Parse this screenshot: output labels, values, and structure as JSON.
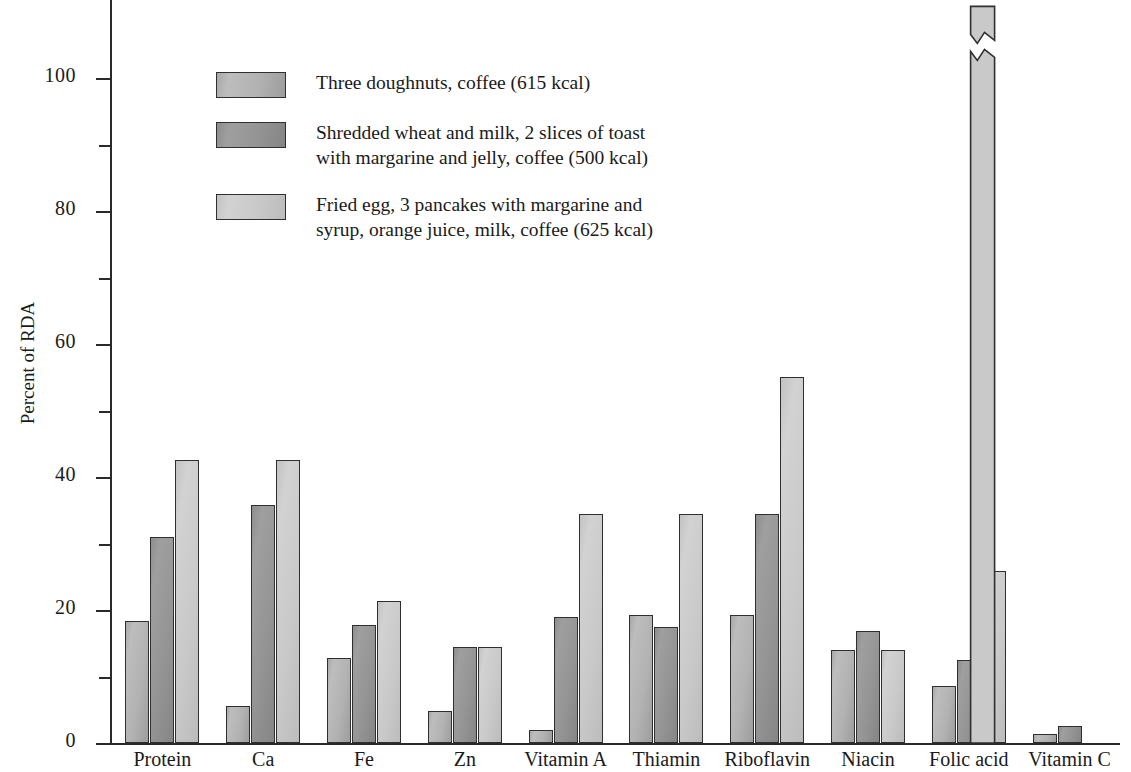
{
  "chart_data": {
    "type": "bar",
    "title": "",
    "xlabel": "",
    "ylabel": "Percent of RDA",
    "ylim": [
      0,
      110
    ],
    "grid": false,
    "legend_position": "inside-top-left",
    "y_major_ticks": [
      "0",
      "20",
      "40",
      "60",
      "80",
      "100"
    ],
    "y_major_tick_values": [
      0,
      20,
      40,
      60,
      80,
      100
    ],
    "y_minor_tick_values": [
      10,
      30,
      50,
      70,
      90
    ],
    "categories": [
      "Protein",
      "Ca",
      "Fe",
      "Zn",
      "Vitamin A",
      "Thiamin",
      "Riboflavin",
      "Niacin",
      "Folic acid",
      "Vitamin C"
    ],
    "series": [
      {
        "name": "Three doughnuts, coffee (615 kcal)",
        "color": "#b2b2b2",
        "values": [
          18.3,
          5.5,
          12.8,
          4.8,
          2.0,
          19.3,
          19.2,
          14.0,
          8.5,
          1.3
        ]
      },
      {
        "name": "Shredded wheat and milk, 2 slices of toast\nwith margarine and jelly, coffee (500 kcal)",
        "color": "#949494",
        "values": [
          31.0,
          35.8,
          17.7,
          14.4,
          19.0,
          17.4,
          34.5,
          16.9,
          12.5,
          2.5
        ]
      },
      {
        "name": "Fried egg, 3 pancakes with margarine and\nsyrup, orange juice, milk, coffee (625 kcal)",
        "color": "#c9c9c9",
        "values": [
          42.5,
          42.6,
          21.3,
          14.5,
          34.4,
          34.5,
          55.0,
          14.0,
          25.8,
          170.0
        ]
      }
    ],
    "annotations": [
      {
        "name": "broken-bar-value",
        "text": "170%",
        "category": "Vitamin C",
        "series": "Fried egg, 3 pancakes with margarine and\nsyrup, orange juice, milk, coffee (625 kcal)",
        "note": "bar axis broken above 104"
      }
    ]
  },
  "axis": {
    "y_title": "Percent of RDA",
    "labels": {
      "t0": "0",
      "t20": "20",
      "t40": "40",
      "t60": "60",
      "t80": "80",
      "t100": "100"
    }
  },
  "categories": {
    "c0": "Protein",
    "c1": "Ca",
    "c2": "Fe",
    "c3": "Zn",
    "c4": "Vitamin A",
    "c5": "Thiamin",
    "c6": "Riboflavin",
    "c7": "Niacin",
    "c8": "Folic acid",
    "c9": "Vitamin C"
  },
  "legend": {
    "items": [
      {
        "label": "Three doughnuts, coffee (615 kcal)"
      },
      {
        "label": "Shredded wheat and milk, 2 slices of toast\nwith margarine and jelly, coffee (500 kcal)"
      },
      {
        "label": "Fried egg, 3 pancakes with margarine and\nsyrup, orange juice, milk, coffee (625 kcal)"
      }
    ]
  },
  "broken_bar": {
    "value_label": "170%"
  }
}
